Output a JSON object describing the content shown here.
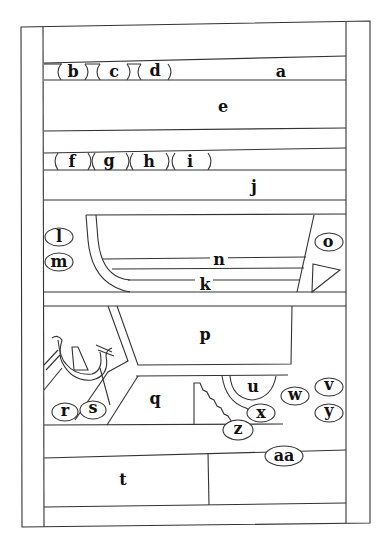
{
  "diagram": {
    "type": "labeled panel schematic",
    "colors": {
      "line": "#333333",
      "text": "#111111",
      "background": "#ffffff"
    },
    "labels": {
      "a": "a",
      "b": "b",
      "c": "c",
      "d": "d",
      "e": "e",
      "f": "f",
      "g": "g",
      "h": "h",
      "i": "i",
      "j": "j",
      "k": "k",
      "l": "l",
      "m": "m",
      "n": "n",
      "o": "o",
      "p": "p",
      "q": "q",
      "r": "r",
      "s": "s",
      "t": "t",
      "u": "u",
      "v": "v",
      "w": "w",
      "x": "x",
      "y": "y",
      "z": "z",
      "aa": "aa"
    },
    "regions": [
      {
        "id": "a",
        "desc": "top narrow band with oval labels b, c, d"
      },
      {
        "id": "e",
        "desc": "wide register"
      },
      {
        "id": "j",
        "desc": "register below band with ovals f, g, h, i"
      },
      {
        "id": "k",
        "desc": "boat-shaped register with inner band n; side ovals l, m, o and triangle"
      },
      {
        "id": "p",
        "desc": "upper trapezoid panel"
      },
      {
        "id": "q",
        "desc": "lower trapezoid panel, with ovals r, s to left and serpent motif"
      },
      {
        "id": "u",
        "desc": "U-shaped niche with stair motif and ovals v, w, x, y, z"
      },
      {
        "id": "t",
        "desc": "bottom left panel; bottom right panel with oval aa"
      }
    ]
  }
}
